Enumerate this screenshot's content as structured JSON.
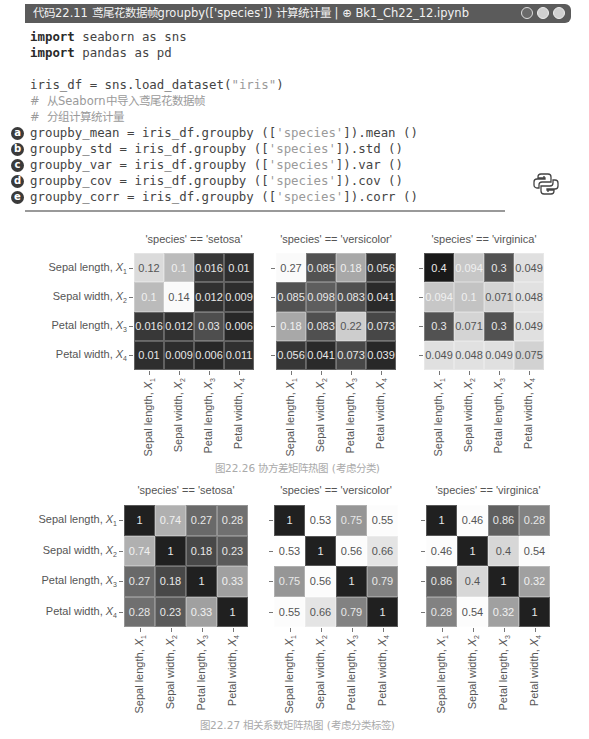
{
  "titlebar": {
    "label": "代码22.11  鸢尾花数据帧groupby(['species']) 计算统计量 | ⊕ Bk1_Ch22_12.ipynb",
    "window_buttons": [
      "circle-dark",
      "circle-light",
      "circle-light"
    ]
  },
  "code": {
    "lines": [
      {
        "kw": "import",
        "rest": " seaborn as sns",
        "marker": ""
      },
      {
        "kw": "import",
        "rest": " pandas as pd",
        "marker": ""
      },
      {
        "kw": "",
        "rest": "",
        "marker": ""
      },
      {
        "kw": "",
        "rest": "iris_df = sns.load_dataset(",
        "str": "\"iris\"",
        "tail": ")",
        "marker": ""
      },
      {
        "comment": "#  从Seaborn中导入鸢尾花数据帧",
        "marker": ""
      },
      {
        "comment": "#  分组计算统计量",
        "marker": ""
      },
      {
        "rest": "groupby_mean = iris_df.groupby ([",
        "str": "'species'",
        "tail": "]).mean ()",
        "marker": "a"
      },
      {
        "rest": "groupby_std = iris_df.groupby ([",
        "str": "'species'",
        "tail": "]).std ()",
        "marker": "b"
      },
      {
        "rest": "groupby_var = iris_df.groupby ([",
        "str": "'species'",
        "tail": "]).var ()",
        "marker": "c"
      },
      {
        "rest": "groupby_cov = iris_df.groupby ([",
        "str": "'species'",
        "tail": "]).cov ()",
        "marker": "d"
      },
      {
        "rest": "groupby_corr = iris_df.groupby ([",
        "str": "'species'",
        "tail": "]).corr ()",
        "marker": "e"
      }
    ],
    "icon": "python-logo-icon"
  },
  "chart_data": [
    {
      "type": "heatmap",
      "title": "'species' == 'setosa'",
      "group": "covariance",
      "row_labels": [
        "Sepal length, X1",
        "Sepal width, X2",
        "Petal length, X3",
        "Petal width, X4"
      ],
      "col_labels": [
        "Sepal length, X1",
        "Sepal width, X2",
        "Petal length, X3",
        "Petal width, X4"
      ],
      "values": [
        [
          0.12,
          0.1,
          0.016,
          0.01
        ],
        [
          0.1,
          0.14,
          0.012,
          0.009
        ],
        [
          0.016,
          0.012,
          0.03,
          0.006
        ],
        [
          0.01,
          0.009,
          0.006,
          0.011
        ]
      ],
      "display": [
        [
          "0.12",
          "0.1",
          "0.016",
          "0.01"
        ],
        [
          "0.1",
          "0.14",
          "0.012",
          "0.009"
        ],
        [
          "0.016",
          "0.012",
          "0.03",
          "0.006"
        ],
        [
          "0.01",
          "0.009",
          "0.006",
          "0.011"
        ]
      ],
      "colormap": "greys_reversed (light=high)"
    },
    {
      "type": "heatmap",
      "title": "'species' == 'versicolor'",
      "group": "covariance",
      "row_labels": [
        "Sepal length, X1",
        "Sepal width, X2",
        "Petal length, X3",
        "Petal width, X4"
      ],
      "col_labels": [
        "Sepal length, X1",
        "Sepal width, X2",
        "Petal length, X3",
        "Petal width, X4"
      ],
      "values": [
        [
          0.27,
          0.085,
          0.18,
          0.056
        ],
        [
          0.085,
          0.098,
          0.083,
          0.041
        ],
        [
          0.18,
          0.083,
          0.22,
          0.073
        ],
        [
          0.056,
          0.041,
          0.073,
          0.039
        ]
      ],
      "display": [
        [
          "0.27",
          "0.085",
          "0.18",
          "0.056"
        ],
        [
          "0.085",
          "0.098",
          "0.083",
          "0.041"
        ],
        [
          "0.18",
          "0.083",
          "0.22",
          "0.073"
        ],
        [
          "0.056",
          "0.041",
          "0.073",
          "0.039"
        ]
      ],
      "colormap": "greys_reversed (light=high)"
    },
    {
      "type": "heatmap",
      "title": "'species' == 'virginica'",
      "group": "covariance",
      "row_labels": [
        "Sepal length, X1",
        "Sepal width, X2",
        "Petal length, X3",
        "Petal width, X4"
      ],
      "col_labels": [
        "Sepal length, X1",
        "Sepal width, X2",
        "Petal length, X3",
        "Petal width, X4"
      ],
      "values": [
        [
          0.4,
          0.094,
          0.3,
          0.049
        ],
        [
          0.094,
          0.1,
          0.071,
          0.048
        ],
        [
          0.3,
          0.071,
          0.3,
          0.049
        ],
        [
          0.049,
          0.048,
          0.049,
          0.075
        ]
      ],
      "display": [
        [
          "0.4",
          "0.094",
          "0.3",
          "0.049"
        ],
        [
          "0.094",
          "0.1",
          "0.071",
          "0.048"
        ],
        [
          "0.3",
          "0.071",
          "0.3",
          "0.049"
        ],
        [
          "0.049",
          "0.048",
          "0.049",
          "0.075"
        ]
      ],
      "colormap": "greys (dark=high)"
    },
    {
      "type": "heatmap",
      "title": "'species' == 'setosa'",
      "group": "correlation",
      "row_labels": [
        "Sepal length, X1",
        "Sepal width, X2",
        "Petal length, X3",
        "Petal width, X4"
      ],
      "col_labels": [
        "Sepal length, X1",
        "Sepal width, X2",
        "Petal length, X3",
        "Petal width, X4"
      ],
      "values": [
        [
          1,
          0.74,
          0.27,
          0.28
        ],
        [
          0.74,
          1,
          0.18,
          0.23
        ],
        [
          0.27,
          0.18,
          1,
          0.33
        ],
        [
          0.28,
          0.23,
          0.33,
          1
        ]
      ],
      "display": [
        [
          "1",
          "0.74",
          "0.27",
          "0.28"
        ],
        [
          "0.74",
          "1",
          "0.18",
          "0.23"
        ],
        [
          "0.27",
          "0.18",
          "1",
          "0.33"
        ],
        [
          "0.28",
          "0.23",
          "0.33",
          "1"
        ]
      ],
      "colormap": "diverging grey"
    },
    {
      "type": "heatmap",
      "title": "'species' == 'versicolor'",
      "group": "correlation",
      "row_labels": [
        "Sepal length, X1",
        "Sepal width, X2",
        "Petal length, X3",
        "Petal width, X4"
      ],
      "col_labels": [
        "Sepal length, X1",
        "Sepal width, X2",
        "Petal length, X3",
        "Petal width, X4"
      ],
      "values": [
        [
          1,
          0.53,
          0.75,
          0.55
        ],
        [
          0.53,
          1,
          0.56,
          0.66
        ],
        [
          0.75,
          0.56,
          1,
          0.79
        ],
        [
          0.55,
          0.66,
          0.79,
          1
        ]
      ],
      "display": [
        [
          "1",
          "0.53",
          "0.75",
          "0.55"
        ],
        [
          "0.53",
          "1",
          "0.56",
          "0.66"
        ],
        [
          "0.75",
          "0.56",
          "1",
          "0.79"
        ],
        [
          "0.55",
          "0.66",
          "0.79",
          "1"
        ]
      ],
      "colormap": "diverging grey"
    },
    {
      "type": "heatmap",
      "title": "'species' == 'virginica'",
      "group": "correlation",
      "row_labels": [
        "Sepal length, X1",
        "Sepal width, X2",
        "Petal length, X3",
        "Petal width, X4"
      ],
      "col_labels": [
        "Sepal length, X1",
        "Sepal width, X2",
        "Petal length, X3",
        "Petal width, X4"
      ],
      "values": [
        [
          1,
          0.46,
          0.86,
          0.28
        ],
        [
          0.46,
          1,
          0.4,
          0.54
        ],
        [
          0.86,
          0.4,
          1,
          0.32
        ],
        [
          0.28,
          0.54,
          0.32,
          1
        ]
      ],
      "display": [
        [
          "1",
          "0.46",
          "0.86",
          "0.28"
        ],
        [
          "0.46",
          "1",
          "0.4",
          "0.54"
        ],
        [
          "0.86",
          "0.4",
          "1",
          "0.32"
        ],
        [
          "0.28",
          "0.54",
          "0.32",
          "1"
        ]
      ],
      "colormap": "diverging grey"
    }
  ],
  "figures": {
    "cov_caption": "图22.26   协方差矩阵热图 (考虑分类)",
    "corr_caption": "图22.27   相关系数矩阵热图 (考虑分类标签)",
    "axis_labels": [
      {
        "name": "Sepal length, ",
        "var": "X",
        "sub": "1"
      },
      {
        "name": "Sepal width, ",
        "var": "X",
        "sub": "2"
      },
      {
        "name": "Petal length, ",
        "var": "X",
        "sub": "3"
      },
      {
        "name": "Petal width, ",
        "var": "X",
        "sub": "4"
      }
    ]
  }
}
